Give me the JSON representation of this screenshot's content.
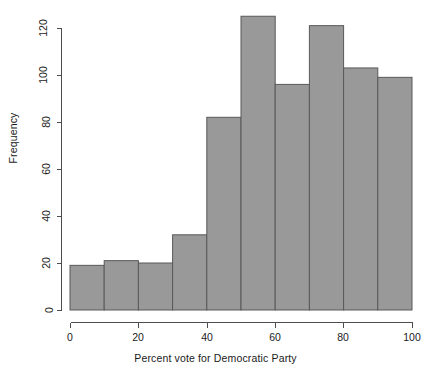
{
  "chart_data": {
    "type": "bar",
    "chart_style": "histogram",
    "title": "",
    "subtitle": "",
    "xlabel": "Percent vote for Democratic Party",
    "ylabel": "Frequency",
    "categories": [
      "0-10",
      "10-20",
      "20-30",
      "30-40",
      "40-50",
      "50-60",
      "60-70",
      "70-80",
      "80-90",
      "90-100"
    ],
    "bin_edges": [
      0,
      10,
      20,
      30,
      40,
      50,
      60,
      70,
      80,
      90,
      100
    ],
    "bin_width": 10,
    "values": [
      19,
      21,
      20,
      32,
      82,
      125,
      96,
      121,
      103,
      99
    ],
    "xlim": [
      0,
      100
    ],
    "ylim": [
      0,
      125
    ],
    "x_ticks": [
      0,
      20,
      40,
      60,
      80,
      100
    ],
    "x_tick_labels": [
      "0",
      "20",
      "40",
      "60",
      "80",
      "100"
    ],
    "y_ticks": [
      0,
      20,
      40,
      60,
      80,
      100,
      120
    ],
    "y_tick_labels": [
      "0",
      "20",
      "40",
      "60",
      "80",
      "100",
      "120"
    ],
    "grid": false,
    "legend": false,
    "legend_position": "none",
    "colors": {
      "bar_fill": "#999999",
      "bar_border": "#595959",
      "axis": "#4d4d4d",
      "text": "#1a1a1a",
      "background": "#ffffff"
    }
  },
  "axes": {
    "x_title": "Percent vote for Democratic Party",
    "y_title": "Frequency"
  }
}
